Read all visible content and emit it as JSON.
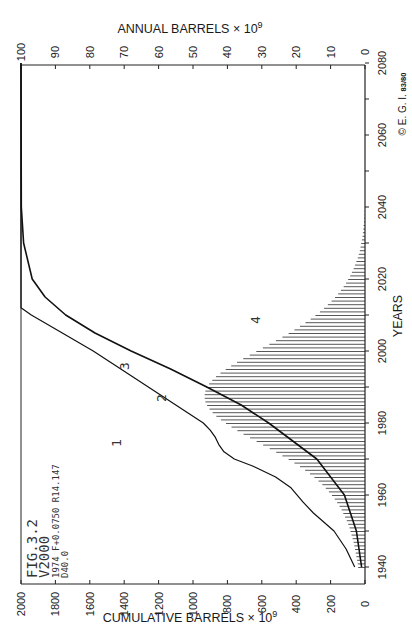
{
  "chart_data": {
    "type": "bar+line",
    "orientation": "rotated-90 (years on vertical axis)",
    "figure_label": {
      "line1": "FIG.3.2",
      "line2": "V2000",
      "line3": "1974 F+0.0750 R14.147",
      "line4": "D40.0"
    },
    "top_axis": {
      "label": "ANNUAL  BARRELS × 10",
      "exp": "9",
      "ticks": [
        100,
        90,
        80,
        70,
        60,
        50,
        40,
        30,
        20,
        10,
        0
      ],
      "range": [
        0,
        100
      ]
    },
    "bottom_axis": {
      "label": "CUMULATIVE  BARRELS × 10",
      "exp": "9",
      "ticks": [
        2000,
        1800,
        1600,
        1400,
        1200,
        1000,
        800,
        600,
        400,
        200,
        0
      ],
      "range": [
        0,
        2000
      ]
    },
    "year_axis": {
      "label": "YEARS",
      "ticks": [
        1940,
        1960,
        1980,
        2000,
        2020,
        2040,
        2060,
        2080
      ],
      "minor_every": 10,
      "range": [
        1935,
        2080
      ]
    },
    "copyright": "© E. G. I.",
    "copyright_small": "83/80",
    "curve_labels": [
      "1",
      "2",
      "3",
      "4"
    ],
    "series": [
      {
        "name": "1/2 historical + projected cumulative discoveries",
        "type": "line",
        "axis": "cumulative",
        "points": [
          [
            1940,
            60
          ],
          [
            1945,
            110
          ],
          [
            1950,
            180
          ],
          [
            1955,
            300
          ],
          [
            1958,
            360
          ],
          [
            1962,
            430
          ],
          [
            1965,
            520
          ],
          [
            1968,
            650
          ],
          [
            1970,
            760
          ],
          [
            1972,
            820
          ],
          [
            1974,
            850
          ],
          [
            1976,
            870
          ],
          [
            1978,
            900
          ],
          [
            1980,
            940
          ],
          [
            1985,
            1100
          ],
          [
            1990,
            1260
          ],
          [
            1995,
            1420
          ],
          [
            2000,
            1580
          ],
          [
            2005,
            1760
          ],
          [
            2010,
            1940
          ],
          [
            2012,
            2000
          ],
          [
            2080,
            2000
          ]
        ]
      },
      {
        "name": "3 cumulative production",
        "type": "line",
        "axis": "cumulative",
        "points": [
          [
            1940,
            20
          ],
          [
            1950,
            50
          ],
          [
            1960,
            120
          ],
          [
            1970,
            280
          ],
          [
            1980,
            560
          ],
          [
            1985,
            720
          ],
          [
            1990,
            920
          ],
          [
            1995,
            1130
          ],
          [
            2000,
            1360
          ],
          [
            2005,
            1570
          ],
          [
            2010,
            1740
          ],
          [
            2015,
            1860
          ],
          [
            2020,
            1935
          ],
          [
            2030,
            1985
          ],
          [
            2040,
            1998
          ],
          [
            2080,
            2000
          ]
        ]
      },
      {
        "name": "4 annual production",
        "type": "bar",
        "axis": "annual",
        "years": [
          1940,
          1941,
          1942,
          1943,
          1944,
          1945,
          1946,
          1947,
          1948,
          1949,
          1950,
          1951,
          1952,
          1953,
          1954,
          1955,
          1956,
          1957,
          1958,
          1959,
          1960,
          1961,
          1962,
          1963,
          1964,
          1965,
          1966,
          1967,
          1968,
          1969,
          1970,
          1971,
          1972,
          1973,
          1974,
          1975,
          1976,
          1977,
          1978,
          1979,
          1980,
          1981,
          1982,
          1983,
          1984,
          1985,
          1986,
          1987,
          1988,
          1989,
          1990,
          1991,
          1992,
          1993,
          1994,
          1995,
          1996,
          1997,
          1998,
          1999,
          2000,
          2001,
          2002,
          2003,
          2004,
          2005,
          2006,
          2007,
          2008,
          2009,
          2010,
          2011,
          2012,
          2013,
          2014,
          2015,
          2016,
          2017,
          2018,
          2019,
          2020,
          2021,
          2022,
          2023,
          2024,
          2025,
          2026,
          2027,
          2028,
          2029,
          2030,
          2031,
          2032,
          2033,
          2034,
          2035,
          2036,
          2037,
          2038,
          2039,
          2040
        ],
        "values": [
          2.0,
          2.1,
          2.3,
          2.5,
          2.7,
          2.9,
          3.1,
          3.3,
          3.6,
          3.9,
          4.2,
          4.5,
          4.9,
          5.3,
          5.8,
          6.3,
          6.8,
          7.4,
          8.1,
          8.8,
          9.6,
          10.5,
          11.4,
          12.4,
          13.5,
          14.7,
          16.0,
          17.4,
          18.9,
          20.5,
          22.2,
          24.0,
          25.8,
          27.7,
          29.6,
          31.5,
          33.4,
          35.3,
          37.1,
          38.8,
          40.4,
          41.9,
          43.2,
          44.3,
          45.2,
          45.9,
          46.4,
          46.6,
          46.6,
          46.4,
          46.0,
          45.3,
          44.4,
          43.3,
          42.0,
          40.5,
          38.9,
          37.2,
          35.4,
          33.5,
          31.6,
          29.7,
          27.8,
          25.9,
          24.0,
          22.2,
          20.5,
          18.9,
          17.3,
          15.8,
          14.4,
          13.1,
          11.9,
          10.8,
          9.7,
          8.7,
          7.8,
          7.0,
          6.2,
          5.5,
          4.9,
          4.3,
          3.8,
          3.3,
          2.9,
          2.5,
          2.1,
          1.8,
          1.5,
          1.3,
          1.1,
          0.9,
          0.7,
          0.6,
          0.5,
          0.4,
          0.3,
          0.2,
          0.15,
          0.1,
          0.05
        ],
        "peak": {
          "year": 1987,
          "value": 46.6
        }
      }
    ]
  }
}
